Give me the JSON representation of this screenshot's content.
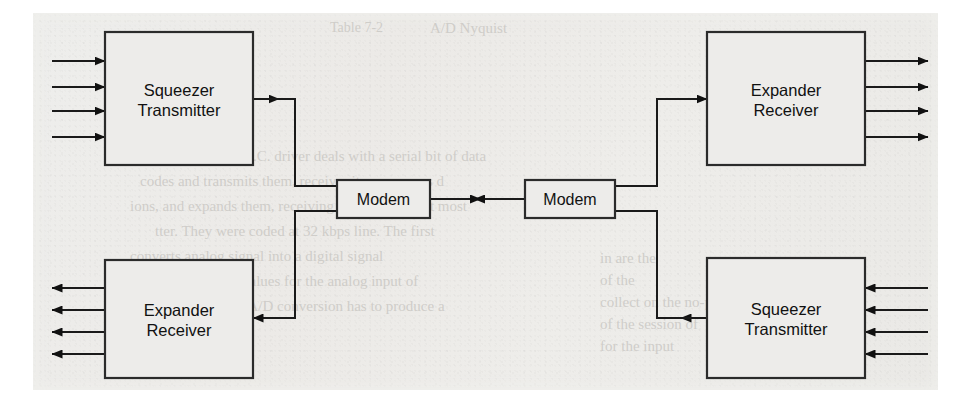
{
  "figure": {
    "kind": "block-diagram",
    "background_color": "#ecebe8",
    "line_color": "#1a1a1a",
    "box_fill": "#edecea"
  },
  "blocks": [
    {
      "id": "top-left-squeezer",
      "line1": "Squeezer",
      "line2": "Transmitter",
      "x": 105,
      "y": 32,
      "w": 148,
      "h": 133,
      "input_count": 4,
      "input_side": "left",
      "output_side": "right"
    },
    {
      "id": "top-right-expander",
      "line1": "Expander",
      "line2": "Receiver",
      "x": 707,
      "y": 32,
      "w": 158,
      "h": 133,
      "output_count": 4,
      "input_side": "left",
      "output_side": "right"
    },
    {
      "id": "bottom-left-expander",
      "line1": "Expander",
      "line2": "Receiver",
      "x": 105,
      "y": 260,
      "w": 148,
      "h": 118,
      "output_count": 4,
      "input_side": "right",
      "output_side": "left"
    },
    {
      "id": "bottom-right-squeezer",
      "line1": "Squeezer",
      "line2": "Transmitter",
      "x": 707,
      "y": 258,
      "w": 158,
      "h": 120,
      "input_count": 4,
      "input_side": "right",
      "output_side": "left"
    }
  ],
  "modems": [
    {
      "id": "modem-left",
      "label": "Modem",
      "x": 337,
      "y": 180,
      "w": 93,
      "h": 38
    },
    {
      "id": "modem-right",
      "label": "Modem",
      "x": 525,
      "y": 180,
      "w": 90,
      "h": 38
    }
  ],
  "channel": {
    "left_arrow_direction": "right",
    "right_arrow_direction": "left",
    "y": 199,
    "from_x": 430,
    "to_x": 525
  },
  "io_lines": {
    "left_input_ys": [
      61,
      87,
      111,
      137
    ],
    "left_output_ys": [
      288,
      310,
      332,
      354
    ],
    "right_output_ys": [
      61,
      87,
      111,
      137
    ],
    "right_input_ys": [
      288,
      310,
      332,
      354
    ],
    "left_stub_x_start": 52,
    "left_stub_x_end": 105,
    "right_stub_x_start": 865,
    "right_stub_x_end": 928
  },
  "connectors": [
    {
      "id": "tl-squeezer-to-left-modem",
      "from": "top-left-squeezer",
      "to": "modem-left",
      "path": "253,99 295,99 295,186 337,186",
      "arrow_at": "start-right"
    },
    {
      "id": "left-modem-to-bl-expander",
      "from": "modem-left",
      "to": "bottom-left-expander",
      "path": "337,211 295,211 295,318 253,318",
      "arrow_at": "end-left"
    },
    {
      "id": "right-modem-to-tr-expander",
      "from": "modem-right",
      "to": "top-right-expander",
      "path": "615,186 657,186 657,99 707,99",
      "arrow_at": "end-right"
    },
    {
      "id": "br-squeezer-to-right-modem",
      "from": "bottom-right-squeezer",
      "to": "modem-right",
      "path": "707,318 657,318 657,211 615,211",
      "arrow_at": "start-right"
    }
  ],
  "ghost_text": [
    {
      "text": "A/D Nyquist",
      "x": 430,
      "y": 20,
      "size": 15
    },
    {
      "text": "Table 7-2",
      "x": 330,
      "y": 20,
      "size": 14
    },
    {
      "text": "The H.C. driver deals with a serial bit of data",
      "x": 215,
      "y": 148,
      "size": 15
    },
    {
      "text": "codes and transmits them, receiver it compresses d",
      "x": 140,
      "y": 173,
      "size": 15
    },
    {
      "text": "ions, and expands them, receiving the bit stream at most",
      "x": 130,
      "y": 198,
      "size": 15
    },
    {
      "text": "tter. They were coded at 32 kbps line. The first",
      "x": 155,
      "y": 223,
      "size": 15
    },
    {
      "text": "converts analog signal into a digital signal",
      "x": 130,
      "y": 248,
      "size": 15
    },
    {
      "text": "that returns discrete values for the analog input of",
      "x": 120,
      "y": 273,
      "size": 15
    },
    {
      "text": "for the reason that an A/D conversion has to produce a",
      "x": 118,
      "y": 298,
      "size": 15
    },
    {
      "text": "ble",
      "x": 120,
      "y": 323,
      "size": 15
    },
    {
      "text": "in are the",
      "x": 600,
      "y": 250,
      "size": 15
    },
    {
      "text": "of the",
      "x": 600,
      "y": 272,
      "size": 15
    },
    {
      "text": "collect on the no-payload",
      "x": 600,
      "y": 294,
      "size": 15
    },
    {
      "text": "of the session of",
      "x": 600,
      "y": 316,
      "size": 15
    },
    {
      "text": "for the input",
      "x": 600,
      "y": 338,
      "size": 15
    }
  ]
}
